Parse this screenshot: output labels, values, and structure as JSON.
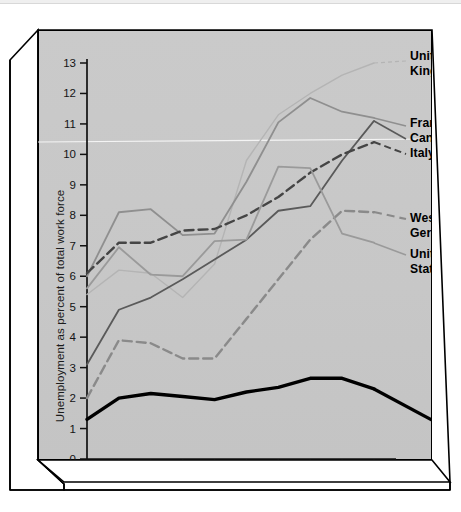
{
  "chart_data": {
    "type": "line",
    "title": "",
    "xlabel": "",
    "ylabel": "Unemployment as percent of total work force",
    "x": [
      1976,
      1977,
      1978,
      1979,
      1980,
      1981,
      1982,
      1983,
      1984,
      1985
    ],
    "xtick_labels": [
      "1976",
      "1977",
      "1978",
      "1979",
      "1980",
      "1981",
      "1982",
      "1983",
      "1984",
      "1985"
    ],
    "ytick_labels": [
      "0",
      "1",
      "2",
      "3",
      "4",
      "5",
      "6",
      "7",
      "8",
      "9",
      "10",
      "11",
      "12",
      "13"
    ],
    "ylim": [
      0,
      13
    ],
    "xlim": [
      1976,
      1985
    ],
    "grid": false,
    "legend_position": "right-inline",
    "series": [
      {
        "name": "United Kingdom",
        "label": "United\nKingdom",
        "color": "#b4b4b4",
        "style": "solid-thin",
        "values": [
          5.4,
          6.2,
          6.1,
          5.3,
          6.4,
          9.8,
          11.3,
          12.0,
          12.6,
          13.0
        ]
      },
      {
        "name": "France",
        "label": "France",
        "color": "#8f8f8f",
        "style": "solid",
        "values": [
          6.0,
          8.1,
          8.2,
          7.35,
          7.4,
          9.1,
          11.05,
          11.85,
          11.4,
          11.2
        ]
      },
      {
        "name": "Canada",
        "label": "Canada",
        "color": "#5a5a5a",
        "style": "solid",
        "values": [
          3.1,
          4.9,
          5.3,
          5.9,
          6.55,
          7.2,
          8.15,
          8.3,
          9.8,
          11.1
        ]
      },
      {
        "name": "Italy",
        "label": "Italy",
        "color": "#454545",
        "style": "dashed",
        "values": [
          6.1,
          7.1,
          7.1,
          7.5,
          7.55,
          8.0,
          8.6,
          9.4,
          10.0,
          10.4
        ]
      },
      {
        "name": "West Germany",
        "label": "West\nGermany",
        "color": "#8a8a8a",
        "style": "dashed",
        "values": [
          2.0,
          3.9,
          3.8,
          3.3,
          3.3,
          4.6,
          5.9,
          7.2,
          8.15,
          8.1
        ]
      },
      {
        "name": "United States",
        "label": "United\nStates",
        "color": "#9a9a9a",
        "style": "solid",
        "values": [
          5.6,
          6.95,
          6.05,
          6.0,
          7.15,
          7.2,
          9.6,
          9.55,
          7.4,
          7.1
        ]
      },
      {
        "name": "Japan",
        "label": "Japan",
        "color": "#000000",
        "style": "bold",
        "values": [
          1.3,
          2.0,
          2.15,
          2.05,
          1.95,
          2.2,
          2.35,
          2.65,
          2.65,
          2.3
        ]
      }
    ],
    "label_anchors": [
      {
        "series": "United Kingdom",
        "lines": [
          "United",
          "Kingdom"
        ],
        "x": 372,
        "y": 30
      },
      {
        "series": "France",
        "lines": [
          "France"
        ],
        "x": 372,
        "y": 97
      },
      {
        "series": "Canada",
        "lines": [
          "Canada"
        ],
        "x": 372,
        "y": 112
      },
      {
        "series": "Italy",
        "lines": [
          "Italy"
        ],
        "x": 372,
        "y": 127
      },
      {
        "series": "West Germany",
        "lines": [
          "West",
          "Germany"
        ],
        "x": 372,
        "y": 192
      },
      {
        "series": "United States",
        "lines": [
          "United",
          "States"
        ],
        "x": 372,
        "y": 228
      },
      {
        "series": "Japan",
        "lines": [
          "Japan"
        ],
        "x": 400,
        "y": 394
      }
    ]
  },
  "figure": {
    "background": "#ffffff",
    "plot_face_color": "#c9c9c9",
    "frame_color": "#000000"
  }
}
